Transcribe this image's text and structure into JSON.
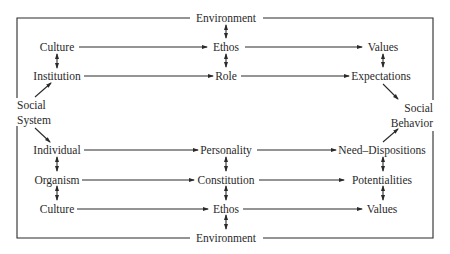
{
  "diagram": {
    "environment_top": "Environment",
    "environment_bottom": "Environment",
    "social_system": [
      "Social",
      "System"
    ],
    "social_behavior": [
      "Social",
      "Behavior"
    ],
    "nomothetic": {
      "left": [
        "Culture",
        "Institution"
      ],
      "middle": [
        "Ethos",
        "Role"
      ],
      "right": [
        "Values",
        "Expectations"
      ]
    },
    "idiographic": {
      "left": [
        "Individual",
        "Organism",
        "Culture"
      ],
      "middle": [
        "Personality",
        "Constitution",
        "Ethos"
      ],
      "right": [
        "Need–Dispositions",
        "Potentialities",
        "Values"
      ]
    }
  }
}
